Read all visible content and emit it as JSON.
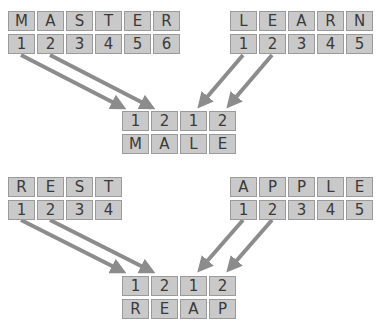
{
  "puzzles": [
    {
      "source_left": {
        "letters": [
          "M",
          "A",
          "S",
          "T",
          "E",
          "R"
        ],
        "numbers": [
          "1",
          "2",
          "3",
          "4",
          "5",
          "6"
        ]
      },
      "source_right": {
        "letters": [
          "L",
          "E",
          "A",
          "R",
          "N"
        ],
        "numbers": [
          "1",
          "2",
          "3",
          "4",
          "5"
        ]
      },
      "result": {
        "numbers": [
          "1",
          "2",
          "1",
          "2"
        ],
        "letters": [
          "M",
          "A",
          "L",
          "E"
        ]
      }
    },
    {
      "source_left": {
        "letters": [
          "R",
          "E",
          "S",
          "T"
        ],
        "numbers": [
          "1",
          "2",
          "3",
          "4"
        ]
      },
      "source_right": {
        "letters": [
          "A",
          "P",
          "P",
          "L",
          "E"
        ],
        "numbers": [
          "1",
          "2",
          "3",
          "4",
          "5"
        ]
      },
      "result": {
        "numbers": [
          "1",
          "2",
          "1",
          "2"
        ],
        "letters": [
          "R",
          "E",
          "A",
          "P"
        ]
      }
    }
  ],
  "colors": {
    "cell_fill": "#c9c9c9",
    "cell_border": "#9a9a9a",
    "arrow": "#8c8c8c",
    "text": "#3a3a3a"
  }
}
